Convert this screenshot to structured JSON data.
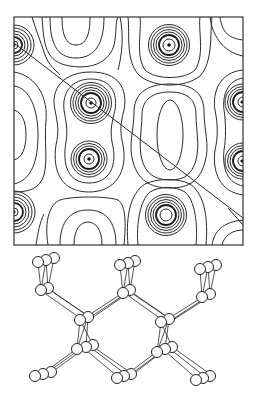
{
  "figure": {
    "panels": [
      {
        "id": "contour-map",
        "type": "charge-density contour plot",
        "frame": {
          "x": 14,
          "y": 17,
          "width": 229,
          "height": 228
        },
        "cut_line": {
          "x1": 14,
          "y1": 43,
          "x2": 243,
          "y2": 218
        },
        "atom_centers": [
          {
            "x": 14,
            "y": 45
          },
          {
            "x": 169,
            "y": 45
          },
          {
            "x": 91,
            "y": 103
          },
          {
            "x": 89,
            "y": 159
          },
          {
            "x": 242,
            "y": 102
          },
          {
            "x": 242,
            "y": 161
          },
          {
            "x": 14,
            "y": 212
          },
          {
            "x": 166,
            "y": 215
          }
        ],
        "minima": [
          {
            "x": 75,
            "y": 25
          },
          {
            "x": 170,
            "y": 135
          },
          {
            "x": 22,
            "y": 135
          },
          {
            "x": 88,
            "y": 245
          }
        ]
      },
      {
        "id": "ball-and-stick",
        "type": "crystal structure (diamond-like lattice, perspective view)"
      }
    ],
    "colors": {
      "line": "#2a2a2a",
      "background": "#ffffff"
    }
  }
}
